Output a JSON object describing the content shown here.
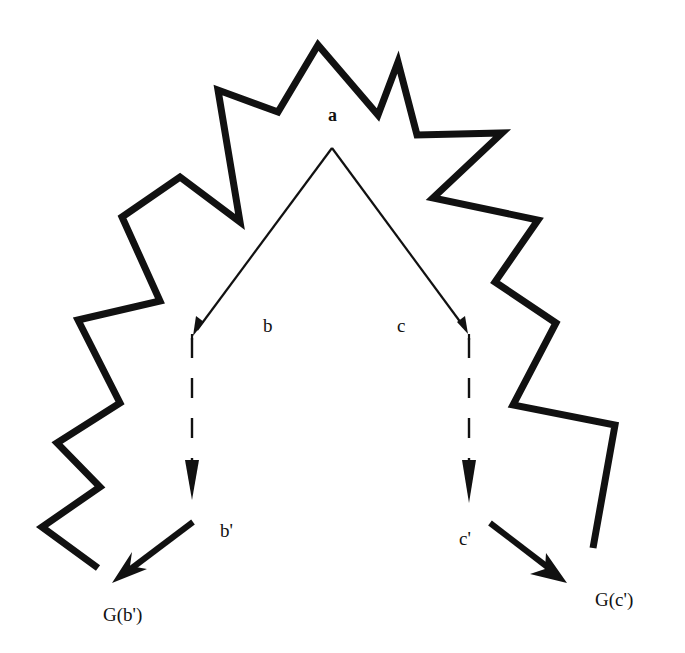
{
  "diagram": {
    "type": "search-tree-with-boundary",
    "colors": {
      "stroke": "#111111",
      "background": "#ffffff"
    },
    "nodes": {
      "a": {
        "label": "a",
        "x": 328,
        "y": 121
      },
      "b": {
        "label": "b",
        "x": 263,
        "y": 332
      },
      "c": {
        "label": "c",
        "x": 397,
        "y": 332
      },
      "b_prime": {
        "label": "b'",
        "x": 220,
        "y": 537
      },
      "c_prime": {
        "label": "c'",
        "x": 459,
        "y": 545
      },
      "G_b_prime": {
        "label": "G(b')",
        "x": 103,
        "y": 621
      },
      "G_c_prime": {
        "label": "G(c')",
        "x": 595,
        "y": 606
      }
    },
    "edges": [
      {
        "from": "a",
        "to": "b",
        "style": "solid-thin",
        "points": [
          [
            332,
            148
          ],
          [
            193,
            335
          ]
        ]
      },
      {
        "from": "a",
        "to": "c",
        "style": "solid-thin",
        "points": [
          [
            332,
            148
          ],
          [
            468,
            333
          ]
        ]
      },
      {
        "from": "b",
        "to": "b_prime",
        "style": "dashed",
        "points": [
          [
            192,
            337
          ],
          [
            192,
            500
          ]
        ]
      },
      {
        "from": "c",
        "to": "c_prime",
        "style": "dashed",
        "points": [
          [
            469,
            337
          ],
          [
            469,
            503
          ]
        ]
      },
      {
        "from": "b_prime",
        "to": "G_b_prime",
        "style": "solid-thick",
        "points": [
          [
            193,
            522
          ],
          [
            112,
            583
          ]
        ]
      },
      {
        "from": "c_prime",
        "to": "G_c_prime",
        "style": "solid-thick",
        "points": [
          [
            490,
            523
          ],
          [
            567,
            583
          ]
        ]
      }
    ],
    "boundary": {
      "description": "jagged thick polyline enclosing the tree",
      "points": [
        [
          98,
          568
        ],
        [
          42,
          527
        ],
        [
          100,
          487
        ],
        [
          57,
          443
        ],
        [
          120,
          403
        ],
        [
          78,
          320
        ],
        [
          160,
          301
        ],
        [
          122,
          217
        ],
        [
          180,
          177
        ],
        [
          240,
          222
        ],
        [
          218,
          90
        ],
        [
          278,
          112
        ],
        [
          318,
          45
        ],
        [
          378,
          115
        ],
        [
          398,
          62
        ],
        [
          417,
          135
        ],
        [
          502,
          133
        ],
        [
          433,
          198
        ],
        [
          538,
          220
        ],
        [
          495,
          282
        ],
        [
          556,
          323
        ],
        [
          513,
          405
        ],
        [
          615,
          425
        ],
        [
          593,
          548
        ]
      ]
    }
  }
}
